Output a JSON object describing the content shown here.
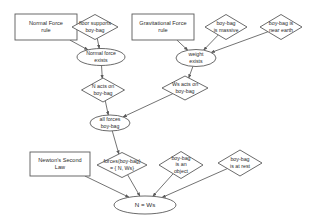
{
  "diagram": {
    "type": "inference-graph",
    "colors": {
      "stroke": "#5a5a5a",
      "text": "#2b2b2b",
      "background": "#ffffff"
    },
    "nodes": [
      {
        "id": "normal-force-rule",
        "shape": "rectangle",
        "lines": [
          "Normal Force",
          "rule"
        ],
        "x": 46,
        "y": 27,
        "w": 62,
        "h": 26
      },
      {
        "id": "floor-supports-boy-bag",
        "shape": "diamond",
        "lines": [
          "floor supports",
          "boy-bag"
        ],
        "x": 95,
        "y": 27,
        "w": 46,
        "h": 25
      },
      {
        "id": "gravitational-force-rule",
        "shape": "rectangle",
        "lines": [
          "Gravitational Force",
          "rule"
        ],
        "x": 163,
        "y": 27,
        "w": 62,
        "h": 26
      },
      {
        "id": "boy-bag-is-massive",
        "shape": "diamond",
        "lines": [
          "boy-bag",
          "is massive"
        ],
        "x": 226,
        "y": 27,
        "w": 42,
        "h": 25
      },
      {
        "id": "boy-bag-is-near-earth",
        "shape": "diamond",
        "lines": [
          "boy-bag is",
          "near earth"
        ],
        "x": 281,
        "y": 27,
        "w": 42,
        "h": 25
      },
      {
        "id": "normal-force-exists",
        "shape": "ellipse",
        "lines": [
          "Normal force",
          "exists"
        ],
        "x": 101,
        "y": 57,
        "w": 48,
        "h": 17
      },
      {
        "id": "weight-exists",
        "shape": "ellipse",
        "lines": [
          "weight",
          "exists"
        ],
        "x": 196,
        "y": 58,
        "w": 40,
        "h": 17
      },
      {
        "id": "n-acts-on-boy-bag",
        "shape": "diamond",
        "lines": [
          "N acts on",
          "boy-bag"
        ],
        "x": 103,
        "y": 90,
        "w": 43,
        "h": 24
      },
      {
        "id": "ws-acts-on-boy-bag",
        "shape": "diamond",
        "lines": [
          "Ws acts on",
          "boy-bag"
        ],
        "x": 185,
        "y": 88,
        "w": 46,
        "h": 24
      },
      {
        "id": "all-forces-boy-bag",
        "shape": "ellipse",
        "lines": [
          "all forces",
          "boy-bag"
        ],
        "x": 110,
        "y": 123,
        "w": 40,
        "h": 16
      },
      {
        "id": "newtons-second-law",
        "shape": "rectangle",
        "lines": [
          "Newton's Second",
          "Law"
        ],
        "x": 60,
        "y": 164,
        "w": 60,
        "h": 24
      },
      {
        "id": "forces-boy-bag-set",
        "shape": "diamond",
        "lines": [
          "forces(boy-bag)",
          "= { N, Ws}"
        ],
        "x": 122,
        "y": 165,
        "w": 50,
        "h": 25
      },
      {
        "id": "boy-bag-is-an-object",
        "shape": "diamond",
        "lines": [
          "boy-bag",
          "is an",
          "object"
        ],
        "x": 181,
        "y": 165,
        "w": 44,
        "h": 27
      },
      {
        "id": "boy-bag-is-at-rest",
        "shape": "diamond",
        "lines": [
          "boy-bag",
          "is at rest"
        ],
        "x": 240,
        "y": 163,
        "w": 44,
        "h": 26
      },
      {
        "id": "n-equals-ws",
        "shape": "ellipse",
        "lines": [
          "N = Ws"
        ],
        "x": 145,
        "y": 205,
        "w": 62,
        "h": 18
      }
    ],
    "edges": [
      {
        "from": "normal-force-rule",
        "to": "normal-force-exists"
      },
      {
        "from": "floor-supports-boy-bag",
        "to": "normal-force-exists"
      },
      {
        "from": "normal-force-exists",
        "to": "n-acts-on-boy-bag"
      },
      {
        "from": "gravitational-force-rule",
        "to": "weight-exists"
      },
      {
        "from": "boy-bag-is-massive",
        "to": "weight-exists"
      },
      {
        "from": "boy-bag-is-near-earth",
        "to": "weight-exists"
      },
      {
        "from": "weight-exists",
        "to": "ws-acts-on-boy-bag"
      },
      {
        "from": "n-acts-on-boy-bag",
        "to": "all-forces-boy-bag"
      },
      {
        "from": "ws-acts-on-boy-bag",
        "to": "all-forces-boy-bag"
      },
      {
        "from": "all-forces-boy-bag",
        "to": "forces-boy-bag-set"
      },
      {
        "from": "newtons-second-law",
        "to": "n-equals-ws"
      },
      {
        "from": "forces-boy-bag-set",
        "to": "n-equals-ws"
      },
      {
        "from": "boy-bag-is-an-object",
        "to": "n-equals-ws"
      },
      {
        "from": "boy-bag-is-at-rest",
        "to": "n-equals-ws"
      }
    ]
  }
}
